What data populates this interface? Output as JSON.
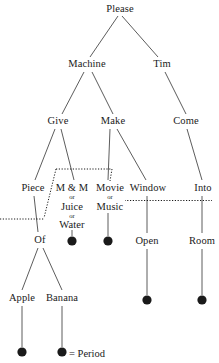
{
  "figure": {
    "type": "sentence-tree-diagram",
    "legend_label": "= Period",
    "terminal_symbol": "filled-circle"
  },
  "nodes": {
    "root": "Please",
    "machine": "Machine",
    "tim": "Tim",
    "give": "Give",
    "make": "Make",
    "come": "Come",
    "piece": "Piece",
    "mm_main": "M & M",
    "mm_or1": "or",
    "mm_alt1": "Juice",
    "mm_or2": "or",
    "mm_alt2": "Water",
    "movie_main": "Movie",
    "movie_or": "or",
    "movie_alt": "Music",
    "window": "Window",
    "into": "Into",
    "of": "Of",
    "open": "Open",
    "room": "Room",
    "apple": "Apple",
    "banana": "Banana"
  },
  "colors": {
    "ink": "#1a1a1a",
    "line": "#4a4a4a",
    "background": "#ffffff"
  }
}
